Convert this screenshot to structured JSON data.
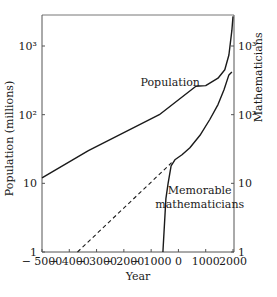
{
  "chart_data": {
    "type": "line",
    "title": "",
    "xlabel": "Year",
    "ylabel": "Population (millions)",
    "y2label": "Mathematicians",
    "xlim": [
      -5000,
      2000
    ],
    "ylim": [
      1,
      3000
    ],
    "y2lim": [
      1,
      3000
    ],
    "yscale": "log",
    "y2scale": "log",
    "grid": false,
    "x_ticks": [
      -5000,
      -4000,
      -3000,
      -2000,
      -1000,
      0,
      1000,
      2000
    ],
    "x_tick_labels": [
      "− 5000",
      "− 4000",
      "− 3000",
      "− 2000",
      "− 1000",
      "0",
      "1000",
      "2000"
    ],
    "y_ticks": [
      1,
      10,
      100,
      1000
    ],
    "y_tick_labels": [
      "1",
      "10",
      "10²",
      "10³"
    ],
    "y2_ticks": [
      1,
      10,
      100,
      1000
    ],
    "y2_tick_labels": [
      "1",
      "10",
      "10²",
      "10³"
    ],
    "series": [
      {
        "name": "Population",
        "axis": "left",
        "style": "solid",
        "x": [
          -5000,
          -3300,
          -700,
          640,
          1000,
          1450,
          1700,
          1850,
          1960,
          2000
        ],
        "y": [
          12,
          30,
          100,
          260,
          265,
          340,
          450,
          740,
          1700,
          2700
        ]
      },
      {
        "name": "Memorable mathematicians",
        "axis": "right",
        "style": "solid",
        "x": [
          -570,
          -460,
          -380,
          -270,
          -130,
          130,
          420,
          790,
          1150,
          1450,
          1670,
          1850,
          1960
        ],
        "y": [
          1,
          6,
          10,
          18,
          22,
          26,
          33,
          50,
          85,
          140,
          230,
          380,
          420
        ]
      },
      {
        "name": "Mathematicians extrapolation",
        "axis": "right",
        "style": "dashed",
        "x": [
          -3700,
          -250
        ],
        "y": [
          1,
          20
        ]
      }
    ],
    "annotations": [
      {
        "text": "Population",
        "x": -300,
        "y": 300
      },
      {
        "text": "Memorable",
        "x": 780,
        "y": 8
      },
      {
        "text": "mathematicians",
        "x": 780,
        "y": 5
      }
    ],
    "legend": "none"
  }
}
